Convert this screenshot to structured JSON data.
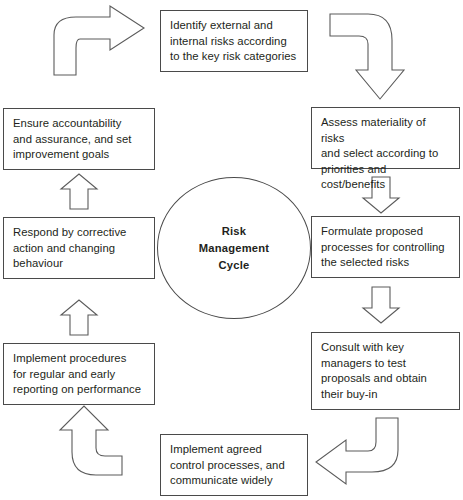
{
  "diagram": {
    "title": "Risk Management Cycle",
    "center": {
      "label": "Risk\nManagement\nCycle"
    },
    "stroke_color": "#4a4a4a",
    "text_color": "#231f20",
    "background_color": "#ffffff",
    "nodes": [
      {
        "id": "identify",
        "order": 1,
        "text": "Identify external and\ninternal risks according\nto the key risk categories",
        "position": "top-center"
      },
      {
        "id": "assess",
        "order": 2,
        "text": "Assess materiality of risks\nand select according to\npriorities and cost/benefits",
        "position": "right-upper"
      },
      {
        "id": "formulate",
        "order": 3,
        "text": "Formulate proposed\nprocesses for controlling\nthe selected risks",
        "position": "right-middle"
      },
      {
        "id": "consult",
        "order": 4,
        "text": "Consult with key\nmanagers to test\nproposals and obtain\ntheir buy-in",
        "position": "right-lower"
      },
      {
        "id": "agreed",
        "order": 5,
        "text": "Implement agreed\ncontrol processes, and\ncommunicate widely",
        "position": "bottom-center"
      },
      {
        "id": "report",
        "order": 6,
        "text": "Implement procedures\nfor regular and early\nreporting on performance",
        "position": "left-lower"
      },
      {
        "id": "respond",
        "order": 7,
        "text": "Respond by corrective\naction and changing\nbehaviour",
        "position": "left-middle"
      },
      {
        "id": "ensure",
        "order": 8,
        "text": "Ensure accountability\nand assurance, and set\nimprovement goals",
        "position": "left-upper"
      }
    ],
    "connectors": [
      {
        "id": "ensure-to-identify",
        "type": "curved",
        "direction": "left-to-right-up",
        "from": "ensure",
        "to": "identify"
      },
      {
        "id": "identify-to-assess",
        "type": "curved",
        "direction": "right-then-down",
        "from": "identify",
        "to": "assess"
      },
      {
        "id": "assess-to-formulate",
        "type": "straight",
        "direction": "down",
        "from": "assess",
        "to": "formulate"
      },
      {
        "id": "formulate-to-consult",
        "type": "straight",
        "direction": "down",
        "from": "formulate",
        "to": "consult"
      },
      {
        "id": "consult-to-agreed",
        "type": "curved",
        "direction": "down-then-left",
        "from": "consult",
        "to": "agreed"
      },
      {
        "id": "agreed-to-report",
        "type": "curved",
        "direction": "left-then-up",
        "from": "agreed",
        "to": "report"
      },
      {
        "id": "report-to-respond",
        "type": "straight",
        "direction": "up",
        "from": "report",
        "to": "respond"
      },
      {
        "id": "respond-to-ensure",
        "type": "straight",
        "direction": "up",
        "from": "respond",
        "to": "ensure"
      }
    ]
  }
}
